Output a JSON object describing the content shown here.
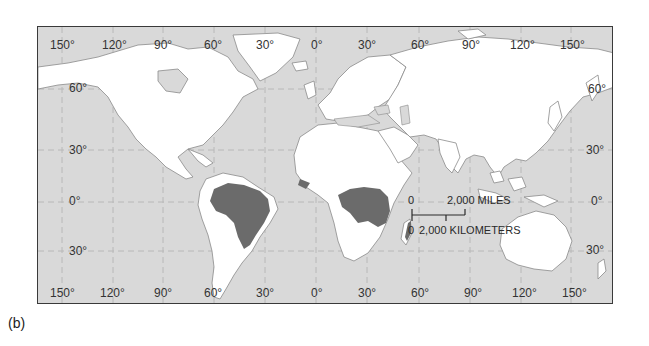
{
  "figure": {
    "panel_label": "(b)",
    "colors": {
      "ocean": "#d9d9d9",
      "land": "#ffffff",
      "rainforest": "#6b6b6b",
      "coastline": "#8a8a8a",
      "grid": "#b8b8b8",
      "frame": "#3a3a3a"
    }
  },
  "map": {
    "top_longitude_labels": [
      "150°",
      "120°",
      "90°",
      "60°",
      "30°",
      "0°",
      "30°",
      "60°",
      "90°",
      "120°",
      "150°"
    ],
    "bottom_longitude_labels": [
      "150°",
      "120°",
      "90°",
      "60°",
      "30°",
      "0°",
      "30°",
      "60°",
      "90°",
      "120°",
      "150°"
    ],
    "left_latitude_labels": [
      "60°",
      "30°",
      "0°",
      "30°"
    ],
    "right_latitude_labels": [
      "60°",
      "30°",
      "0°",
      "30°"
    ],
    "scale_bar": {
      "miles_zero": "0",
      "miles_label": "2,000 MILES",
      "km_zero": "0",
      "km_label": "2,000 KILOMETERS"
    },
    "highlighted_regions": [
      "Amazon Basin (South America)",
      "Congo Basin (Central Africa)",
      "Eastern Madagascar"
    ]
  }
}
